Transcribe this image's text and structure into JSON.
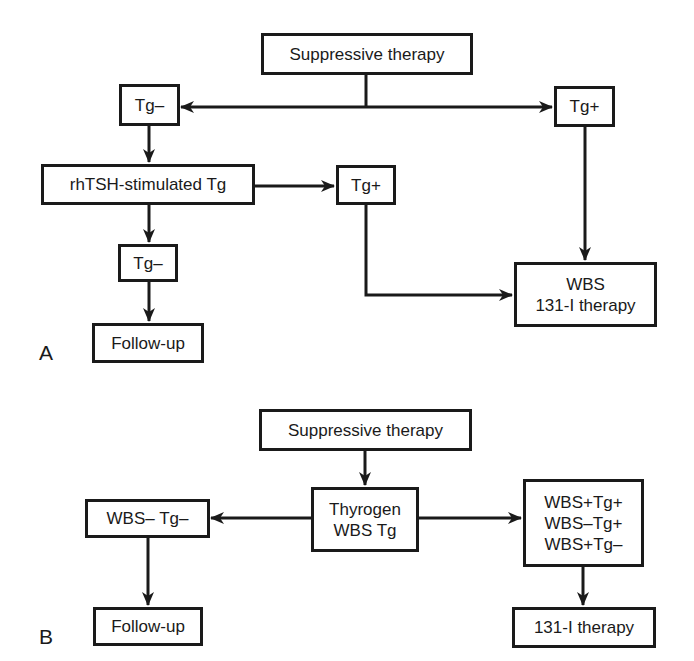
{
  "colors": {
    "stroke": "#1a1a1a",
    "background": "#ffffff"
  },
  "panel_a": {
    "label": "A",
    "nodes": {
      "suppressive_therapy": "Suppressive therapy",
      "tg_negative_top": "Tg–",
      "tg_positive_right": "Tg+",
      "rhtsh_stimulated_tg": "rhTSH-stimulated Tg",
      "tg_positive_mid": "Tg+",
      "tg_negative_lower": "Tg–",
      "follow_up": "Follow-up",
      "wbs_therapy": [
        "WBS",
        "131-I therapy"
      ]
    },
    "edges": [
      {
        "from": "Suppressive therapy",
        "to": "Tg–"
      },
      {
        "from": "Suppressive therapy",
        "to": "Tg+"
      },
      {
        "from": "Tg–",
        "to": "rhTSH-stimulated Tg"
      },
      {
        "from": "rhTSH-stimulated Tg",
        "to": "Tg+"
      },
      {
        "from": "rhTSH-stimulated Tg",
        "to": "Tg–"
      },
      {
        "from": "Tg–",
        "to": "Follow-up"
      },
      {
        "from": "Tg+",
        "to": "WBS / 131-I therapy"
      },
      {
        "from": "Tg+ (rhTSH)",
        "to": "WBS / 131-I therapy"
      }
    ]
  },
  "panel_b": {
    "label": "B",
    "nodes": {
      "suppressive_therapy": "Suppressive therapy",
      "thyrogen_wbs_tg": [
        "Thyrogen",
        "WBS Tg"
      ],
      "wbs_neg_tg_neg": "WBS– Tg–",
      "positive_results": [
        "WBS+Tg+",
        "WBS–Tg+",
        "WBS+Tg–"
      ],
      "follow_up": "Follow-up",
      "therapy_131i": "131-I therapy"
    },
    "edges": [
      {
        "from": "Suppressive therapy",
        "to": "Thyrogen WBS Tg"
      },
      {
        "from": "Thyrogen WBS Tg",
        "to": "WBS– Tg–"
      },
      {
        "from": "Thyrogen WBS Tg",
        "to": "WBS+Tg+ / WBS–Tg+ / WBS+Tg–"
      },
      {
        "from": "WBS– Tg–",
        "to": "Follow-up"
      },
      {
        "from": "WBS+Tg+ / WBS–Tg+ / WBS+Tg–",
        "to": "131-I therapy"
      }
    ]
  }
}
